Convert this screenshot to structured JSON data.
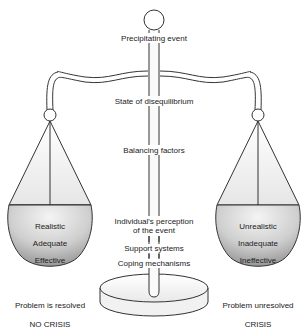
{
  "figure": {
    "center_labels": {
      "top": "Precipitating event",
      "state": "State of disequilibrium",
      "balancing": "Balancing factors",
      "perception_line1": "Individual's perception",
      "perception_line2": "of the event",
      "support": "Support systems",
      "coping": "Coping mechanisms"
    },
    "left_pan": {
      "items": [
        "Realistic",
        "Adequate",
        "Effective"
      ],
      "outcome": "Problem is resolved",
      "result": "NO CRISIS"
    },
    "right_pan": {
      "items": [
        "Unrealistic",
        "Inadequate",
        "Ineffective"
      ],
      "outcome": "Problem unresolved",
      "result": "CRISIS"
    },
    "colors": {
      "stroke": "#333333",
      "pan_fill_light": "#f2f2f2",
      "pan_fill_dark": "#9a9a9a",
      "background": "#ffffff"
    }
  }
}
